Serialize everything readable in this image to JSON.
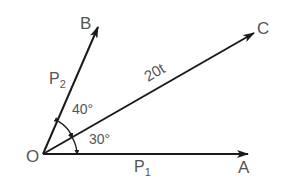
{
  "diagram": {
    "type": "vector-force-diagram",
    "origin": {
      "label": "O"
    },
    "vectors": [
      {
        "id": "OA",
        "end_label": "A",
        "magnitude_label": "P",
        "magnitude_sub": "1",
        "angle_from_OA_deg": 0
      },
      {
        "id": "OC",
        "end_label": "C",
        "magnitude_label": "20t",
        "angle_from_OA_deg": 30
      },
      {
        "id": "OB",
        "end_label": "B",
        "magnitude_label": "P",
        "magnitude_sub": "2",
        "angle_from_OA_deg": 70
      }
    ],
    "angles": [
      {
        "between": [
          "OA",
          "OC"
        ],
        "label": "30°"
      },
      {
        "between": [
          "OC",
          "OB"
        ],
        "label": "40°"
      }
    ],
    "colors": {
      "line": "#1a1a1a",
      "text": "#555555",
      "background": "#ffffff"
    }
  }
}
